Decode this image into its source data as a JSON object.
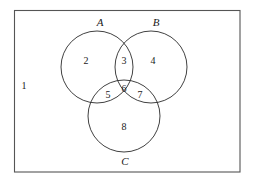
{
  "diagram": {
    "kind": "venn-diagram",
    "colors": {
      "background": "#ffffff",
      "circle_stroke": "#2b2b2b",
      "rect_stroke": "#555555",
      "text": "#1a1a1a"
    },
    "universe": {
      "label": "1",
      "rect": {
        "x": 14,
        "y": 10,
        "width": 226,
        "height": 162
      },
      "label_position": {
        "x": 24,
        "y": 87
      }
    },
    "sets": [
      {
        "id": "A",
        "label": "A",
        "circle": {
          "cx": 97,
          "cy": 67,
          "r": 36
        },
        "label_position": {
          "x": 100,
          "y": 23
        }
      },
      {
        "id": "B",
        "label": "B",
        "circle": {
          "cx": 151,
          "cy": 67,
          "r": 36
        },
        "label_position": {
          "x": 156,
          "y": 23
        }
      },
      {
        "id": "C",
        "label": "C",
        "circle": {
          "cx": 124,
          "cy": 116,
          "r": 36
        },
        "label_position": {
          "x": 125,
          "y": 162
        }
      }
    ],
    "regions": [
      {
        "number": "1",
        "meaning": "outside-all",
        "x": 24,
        "y": 87
      },
      {
        "number": "2",
        "meaning": "A-only",
        "x": 86,
        "y": 62
      },
      {
        "number": "3",
        "meaning": "A-and-B",
        "x": 124,
        "y": 62
      },
      {
        "number": "4",
        "meaning": "B-only",
        "x": 153,
        "y": 62
      },
      {
        "number": "5",
        "meaning": "A-and-C",
        "x": 108,
        "y": 96
      },
      {
        "number": "6",
        "meaning": "A-and-B-and-C",
        "x": 124,
        "y": 90
      },
      {
        "number": "7",
        "meaning": "B-and-C",
        "x": 140,
        "y": 96
      },
      {
        "number": "8",
        "meaning": "C-only",
        "x": 124,
        "y": 128
      }
    ]
  }
}
